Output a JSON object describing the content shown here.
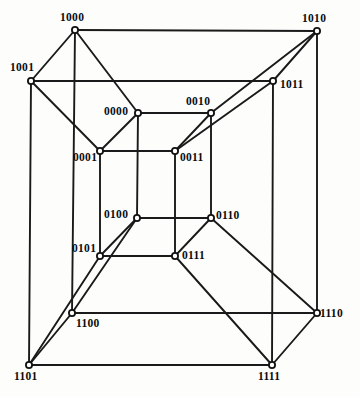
{
  "figure": {
    "name": "tesseract-4-cube-graph",
    "background_color": "#fdfdfb",
    "edge_color": "#1a1a1a",
    "vertex_fill": "#ffffff",
    "vertex_stroke": "#111111"
  },
  "chart_data": {
    "type": "diagram",
    "title": "",
    "xlabel": "",
    "ylabel": "",
    "layout": "4-dimensional hypercube (tesseract) drawn as an inner cube nested inside an outer cube",
    "nodes": [
      {
        "label": "1000",
        "x": 75,
        "y": 30,
        "label_x": 60,
        "label_y": 12,
        "cube": "outer"
      },
      {
        "label": "1010",
        "x": 317,
        "y": 31,
        "label_x": 302,
        "label_y": 13,
        "cube": "outer"
      },
      {
        "label": "1001",
        "x": 31,
        "y": 81,
        "label_x": 10,
        "label_y": 62,
        "cube": "outer"
      },
      {
        "label": "1011",
        "x": 273,
        "y": 81,
        "label_x": 280,
        "label_y": 79,
        "cube": "outer"
      },
      {
        "label": "1100",
        "x": 72,
        "y": 313,
        "label_x": 76,
        "label_y": 318,
        "cube": "outer"
      },
      {
        "label": "1110",
        "x": 317,
        "y": 313,
        "label_x": 320,
        "label_y": 308,
        "cube": "outer"
      },
      {
        "label": "1101",
        "x": 29,
        "y": 365,
        "label_x": 14,
        "label_y": 371,
        "cube": "outer"
      },
      {
        "label": "1111",
        "x": 272,
        "y": 365,
        "label_x": 258,
        "label_y": 371,
        "cube": "outer"
      },
      {
        "label": "0000",
        "x": 138,
        "y": 113,
        "label_x": 104,
        "label_y": 106,
        "cube": "inner"
      },
      {
        "label": "0010",
        "x": 211,
        "y": 113,
        "label_x": 186,
        "label_y": 96,
        "cube": "inner"
      },
      {
        "label": "0001",
        "x": 100,
        "y": 151,
        "label_x": 73,
        "label_y": 152,
        "cube": "inner"
      },
      {
        "label": "0011",
        "x": 175,
        "y": 151,
        "label_x": 180,
        "label_y": 152,
        "cube": "inner"
      },
      {
        "label": "0100",
        "x": 137,
        "y": 218,
        "label_x": 104,
        "label_y": 209,
        "cube": "inner"
      },
      {
        "label": "0110",
        "x": 211,
        "y": 218,
        "label_x": 216,
        "label_y": 210,
        "cube": "inner"
      },
      {
        "label": "0101",
        "x": 100,
        "y": 256,
        "label_x": 72,
        "label_y": 243,
        "cube": "inner"
      },
      {
        "label": "0111",
        "x": 175,
        "y": 256,
        "label_x": 182,
        "label_y": 250,
        "cube": "inner"
      }
    ],
    "edges": [
      [
        "1000",
        "1010"
      ],
      [
        "1000",
        "1001"
      ],
      [
        "1000",
        "1100"
      ],
      [
        "1000",
        "0000"
      ],
      [
        "1010",
        "1011"
      ],
      [
        "1010",
        "1110"
      ],
      [
        "1010",
        "0010"
      ],
      [
        "1001",
        "1011"
      ],
      [
        "1001",
        "1101"
      ],
      [
        "1001",
        "0001"
      ],
      [
        "1011",
        "1111"
      ],
      [
        "1011",
        "0011"
      ],
      [
        "1100",
        "1110"
      ],
      [
        "1100",
        "1101"
      ],
      [
        "1100",
        "0100"
      ],
      [
        "1110",
        "1111"
      ],
      [
        "1110",
        "0110"
      ],
      [
        "1101",
        "1111"
      ],
      [
        "1101",
        "0101"
      ],
      [
        "1111",
        "0111"
      ],
      [
        "0000",
        "0010"
      ],
      [
        "0000",
        "0001"
      ],
      [
        "0000",
        "0100"
      ],
      [
        "0010",
        "0011"
      ],
      [
        "0010",
        "0110"
      ],
      [
        "0001",
        "0011"
      ],
      [
        "0001",
        "0101"
      ],
      [
        "0011",
        "0111"
      ],
      [
        "0100",
        "0110"
      ],
      [
        "0100",
        "0101"
      ],
      [
        "0110",
        "0111"
      ],
      [
        "0101",
        "0111"
      ]
    ]
  }
}
